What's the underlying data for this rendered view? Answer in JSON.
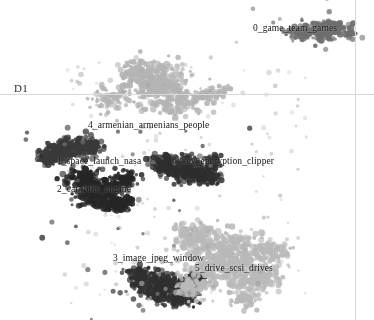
{
  "chart_data": {
    "type": "scatter",
    "title": "",
    "subtitle": "",
    "xlabel": "",
    "ylabel": "D1",
    "grid": false,
    "legend_position": "none",
    "axes": {
      "horizontal_rule_y_px": 94,
      "vertical_rule_x_px": 355,
      "axis_name": "D1"
    },
    "annotations": [
      {
        "id": "0",
        "text": "0_game_team_games",
        "x_px": 253,
        "y_px": 23,
        "cluster_cx": 318,
        "cluster_cy": 30
      },
      {
        "id": "4",
        "text": "4_armenian_armenians_people",
        "x_px": 88,
        "y_px": 120,
        "cluster_cx": 160,
        "cluster_cy": 95
      },
      {
        "id": "1",
        "text": "1_space_launch_nasa",
        "x_px": 57,
        "y_px": 156,
        "cluster_cx": 68,
        "cluster_cy": 150
      },
      {
        "id": "6",
        "text": "6_key_encryption_clipper",
        "x_px": 172,
        "y_px": 156,
        "cluster_cx": 185,
        "cluster_cy": 170
      },
      {
        "id": "2",
        "text": "2_car_bike_engine",
        "x_px": 57,
        "y_px": 184,
        "cluster_cx": 100,
        "cluster_cy": 190
      },
      {
        "id": "3",
        "text": "3_image_jpeg_window",
        "x_px": 113,
        "y_px": 253,
        "cluster_cx": 165,
        "cluster_cy": 285
      },
      {
        "id": "5",
        "text": "5_drive_scsi_drives",
        "x_px": 195,
        "y_px": 263,
        "cluster_cx": 235,
        "cluster_cy": 265
      }
    ],
    "series": [
      {
        "name": "0_game_team_games",
        "color": "#6e6e6e",
        "point_count": 240,
        "centroid": [
          318,
          30
        ],
        "spread": [
          26,
          11
        ],
        "blobs": [
          [
            318,
            30,
            26,
            11
          ],
          [
            300,
            34,
            13,
            7
          ],
          [
            336,
            27,
            12,
            6
          ],
          [
            348,
            34,
            9,
            4
          ]
        ]
      },
      {
        "name": "4_armenian_armenians_people",
        "color": "#b4b4b4",
        "point_count": 560,
        "centroid": [
          160,
          92
        ],
        "spread": [
          48,
          30
        ],
        "blobs": [
          [
            158,
            85,
            38,
            24
          ],
          [
            140,
            72,
            22,
            14
          ],
          [
            176,
            100,
            26,
            16
          ],
          [
            110,
            100,
            18,
            12
          ],
          [
            206,
            96,
            14,
            9
          ],
          [
            222,
            92,
            10,
            7
          ]
        ]
      },
      {
        "name": "1_space_launch_nasa",
        "color": "#3a3a3a",
        "point_count": 330,
        "centroid": [
          70,
          152
        ],
        "spread": [
          26,
          14
        ],
        "blobs": [
          [
            66,
            150,
            22,
            12
          ],
          [
            88,
            146,
            14,
            9
          ],
          [
            48,
            158,
            12,
            8
          ]
        ]
      },
      {
        "name": "6_key_encryption_clipper",
        "color": "#2e2e2e",
        "point_count": 420,
        "centroid": [
          186,
          172
        ],
        "spread": [
          30,
          16
        ],
        "blobs": [
          [
            184,
            170,
            26,
            14
          ],
          [
            206,
            178,
            15,
            9
          ],
          [
            164,
            164,
            14,
            9
          ],
          [
            214,
            162,
            9,
            6
          ]
        ]
      },
      {
        "name": "2_car_bike_engine",
        "color": "#262626",
        "point_count": 520,
        "centroid": [
          100,
          192
        ],
        "spread": [
          30,
          20
        ],
        "blobs": [
          [
            100,
            192,
            26,
            17
          ],
          [
            82,
            178,
            16,
            11
          ],
          [
            118,
            204,
            15,
            10
          ],
          [
            126,
            180,
            11,
            8
          ]
        ]
      },
      {
        "name": "3_image_jpeg_window",
        "color": "#303030",
        "point_count": 470,
        "centroid": [
          163,
          287
        ],
        "spread": [
          32,
          19
        ],
        "blobs": [
          [
            162,
            288,
            28,
            16
          ],
          [
            142,
            276,
            16,
            10
          ],
          [
            182,
            296,
            16,
            10
          ],
          [
            196,
            278,
            11,
            7
          ]
        ]
      },
      {
        "name": "5_drive_scsi_drives",
        "color": "#b9b9b9",
        "point_count": 900,
        "centroid": [
          225,
          262
        ],
        "spread": [
          56,
          36
        ],
        "blobs": [
          [
            224,
            258,
            46,
            30
          ],
          [
            196,
            238,
            24,
            15
          ],
          [
            256,
            276,
            26,
            17
          ],
          [
            272,
            250,
            18,
            12
          ],
          [
            188,
            288,
            18,
            12
          ],
          [
            246,
            300,
            16,
            10
          ]
        ]
      }
    ],
    "noise": {
      "name": "scattered-outliers",
      "color": "#9a9a9a",
      "point_count": 150
    }
  }
}
